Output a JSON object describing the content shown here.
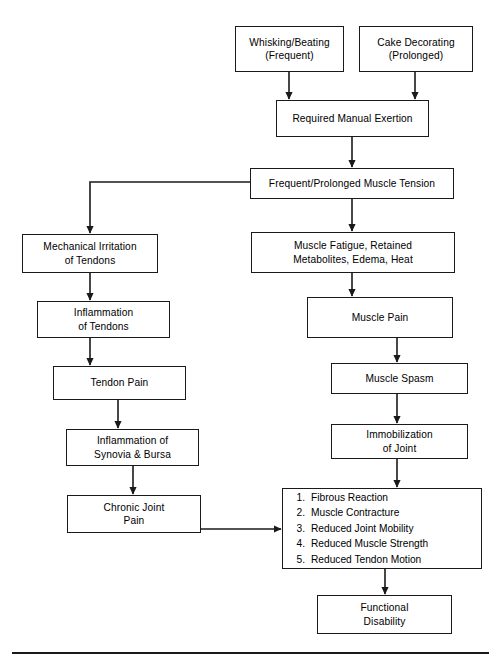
{
  "diagram": {
    "line_color": "#1a1a1a",
    "background": "#ffffff",
    "nodes": {
      "whisking": {
        "label": "Whisking/Beating\n(Frequent)"
      },
      "cake": {
        "label": "Cake Decorating\n(Prolonged)"
      },
      "exertion": {
        "label": "Required Manual Exertion"
      },
      "tension": {
        "label": "Frequent/Prolonged Muscle Tension"
      },
      "mechanical": {
        "label": "Mechanical Irritation\nof Tendons"
      },
      "inflammation_tendons": {
        "label": "Inflammation\nof Tendons"
      },
      "tendon_pain": {
        "label": "Tendon Pain"
      },
      "inflammation_synovia": {
        "label": "Inflammation of\nSynovia & Bursa"
      },
      "chronic_joint_pain": {
        "label": "Chronic Joint\nPain"
      },
      "muscle_fatigue": {
        "label": "Muscle Fatigue, Retained\nMetabolites, Edema, Heat"
      },
      "muscle_pain": {
        "label": "Muscle Pain"
      },
      "muscle_spasm": {
        "label": "Muscle Spasm"
      },
      "immobilization": {
        "label": "Immobilization\nof Joint"
      },
      "outcomes": {
        "items": [
          "Fibrous Reaction",
          "Muscle Contracture",
          "Reduced Joint Mobility",
          "Reduced Muscle Strength",
          "Reduced Tendon Motion"
        ]
      },
      "functional_disability": {
        "label": "Functional\nDisability"
      }
    }
  }
}
